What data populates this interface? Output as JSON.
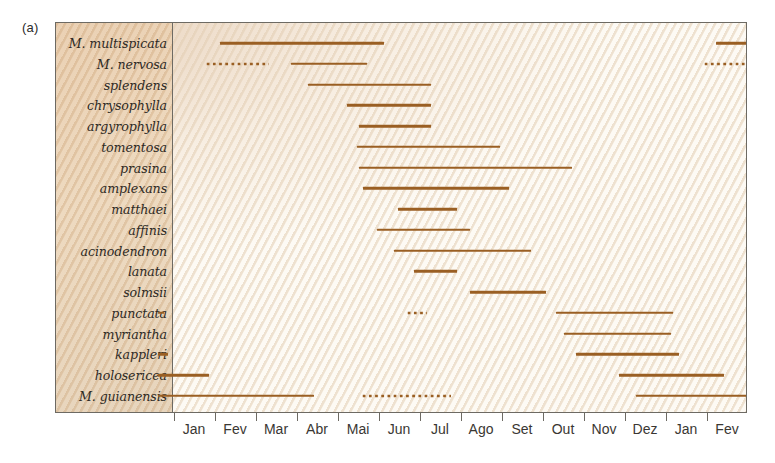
{
  "figure": {
    "panel_letter": "(a)",
    "bar_color": "#9a5f23",
    "frame_color": "#6d6a63",
    "label_panel_color": "#e4c5a3"
  },
  "chart_data": {
    "type": "bar",
    "title": "",
    "xlabel": "",
    "ylabel": "",
    "orientation": "horizontal",
    "grid": false,
    "legend": null,
    "note": "Gantt-style flowering/phenology chart. Solid bars = confirmed period, dotted bars = uncertain/occasional period. X axis spans 14 months (Jan through Fev of following year).",
    "x_axis": {
      "tick_labels": [
        "Jan",
        "Fev",
        "Mar",
        "Abr",
        "Mai",
        "Jun",
        "Jul",
        "Ago",
        "Set",
        "Out",
        "Nov",
        "Dez",
        "Jan",
        "Fev"
      ],
      "tick_positions_month_index": [
        0,
        1,
        2,
        3,
        4,
        5,
        6,
        7,
        8,
        9,
        10,
        11,
        12,
        13
      ],
      "xlim_month_index": [
        -0.45,
        13.55
      ]
    },
    "categories": [
      "M. multispicata",
      "M. nervosa",
      "splendens",
      "chrysophylla",
      "argyrophylla",
      "tomentosa",
      "prasina",
      "amplexans",
      "matthaei",
      "affinis",
      "acinodendron",
      "lanata",
      "solmsii",
      "punctata",
      "myriantha",
      "kappleri",
      "holosericea",
      "M. guianensis"
    ],
    "rows": [
      {
        "species": "M. multispicata",
        "segments": [
          {
            "start": 1.1,
            "end": 5.1,
            "style": "solid"
          },
          {
            "start": 13.2,
            "end": 14.0,
            "style": "solid"
          }
        ]
      },
      {
        "species": "M. nervosa",
        "segments": [
          {
            "start": 0.75,
            "end": 2.3,
            "style": "dotted"
          },
          {
            "start": 2.85,
            "end": 4.7,
            "style": "solid"
          },
          {
            "start": 12.9,
            "end": 14.0,
            "style": "dotted"
          }
        ]
      },
      {
        "species": "splendens",
        "segments": [
          {
            "start": 3.25,
            "end": 6.25,
            "style": "solid"
          }
        ]
      },
      {
        "species": "chrysophylla",
        "segments": [
          {
            "start": 4.2,
            "end": 6.25,
            "style": "solid"
          }
        ]
      },
      {
        "species": "argyrophylla",
        "segments": [
          {
            "start": 4.5,
            "end": 6.25,
            "style": "solid"
          }
        ]
      },
      {
        "species": "tomentosa",
        "segments": [
          {
            "start": 4.45,
            "end": 7.95,
            "style": "solid"
          }
        ]
      },
      {
        "species": "prasina",
        "segments": [
          {
            "start": 4.5,
            "end": 9.7,
            "style": "solid"
          }
        ]
      },
      {
        "species": "amplexans",
        "segments": [
          {
            "start": 4.6,
            "end": 8.15,
            "style": "solid"
          }
        ]
      },
      {
        "species": "matthaei",
        "segments": [
          {
            "start": 5.45,
            "end": 6.9,
            "style": "solid"
          }
        ]
      },
      {
        "species": "affinis",
        "segments": [
          {
            "start": 4.95,
            "end": 7.2,
            "style": "solid"
          }
        ]
      },
      {
        "species": "acinodendron",
        "segments": [
          {
            "start": 5.35,
            "end": 8.7,
            "style": "solid"
          }
        ]
      },
      {
        "species": "lanata",
        "segments": [
          {
            "start": 5.85,
            "end": 6.9,
            "style": "solid"
          }
        ]
      },
      {
        "species": "solmsii",
        "segments": [
          {
            "start": 7.2,
            "end": 9.05,
            "style": "solid"
          }
        ]
      },
      {
        "species": "punctata",
        "segments": [
          {
            "start": -0.4,
            "end": -0.25,
            "style": "solid"
          },
          {
            "start": 5.65,
            "end": 6.15,
            "style": "dotted"
          },
          {
            "start": 9.3,
            "end": 12.15,
            "style": "solid"
          }
        ]
      },
      {
        "species": "myriantha",
        "segments": [
          {
            "start": 9.5,
            "end": 12.1,
            "style": "solid"
          }
        ]
      },
      {
        "species": "kappleri",
        "segments": [
          {
            "start": -0.4,
            "end": -0.15,
            "style": "solid"
          },
          {
            "start": 9.8,
            "end": 12.3,
            "style": "solid"
          }
        ]
      },
      {
        "species": "holosericea",
        "segments": [
          {
            "start": -0.4,
            "end": 0.85,
            "style": "solid"
          },
          {
            "start": 10.85,
            "end": 13.4,
            "style": "solid"
          }
        ]
      },
      {
        "species": "M. guianensis",
        "segments": [
          {
            "start": -0.4,
            "end": 3.4,
            "style": "solid"
          },
          {
            "start": 4.55,
            "end": 6.75,
            "style": "dotted"
          },
          {
            "start": 11.25,
            "end": 14.0,
            "style": "solid"
          }
        ]
      }
    ]
  }
}
